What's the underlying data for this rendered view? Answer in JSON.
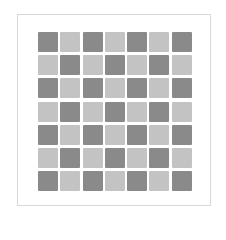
{
  "figure": {
    "rows": 7,
    "cols": 7,
    "colors": {
      "dark": "#8a8a8a",
      "light": "#c3c3c3",
      "frame": "#d8d8d8",
      "background": "#ffffff"
    },
    "pattern": [
      [
        "dark",
        "light",
        "dark",
        "light",
        "dark",
        "light",
        "dark"
      ],
      [
        "light",
        "dark",
        "light",
        "dark",
        "light",
        "dark",
        "light"
      ],
      [
        "dark",
        "light",
        "dark",
        "light",
        "dark",
        "light",
        "dark"
      ],
      [
        "light",
        "dark",
        "light",
        "dark",
        "light",
        "dark",
        "light"
      ],
      [
        "dark",
        "light",
        "dark",
        "light",
        "dark",
        "light",
        "dark"
      ],
      [
        "light",
        "dark",
        "light",
        "dark",
        "light",
        "dark",
        "light"
      ],
      [
        "dark",
        "light",
        "dark",
        "light",
        "dark",
        "light",
        "dark"
      ]
    ]
  }
}
